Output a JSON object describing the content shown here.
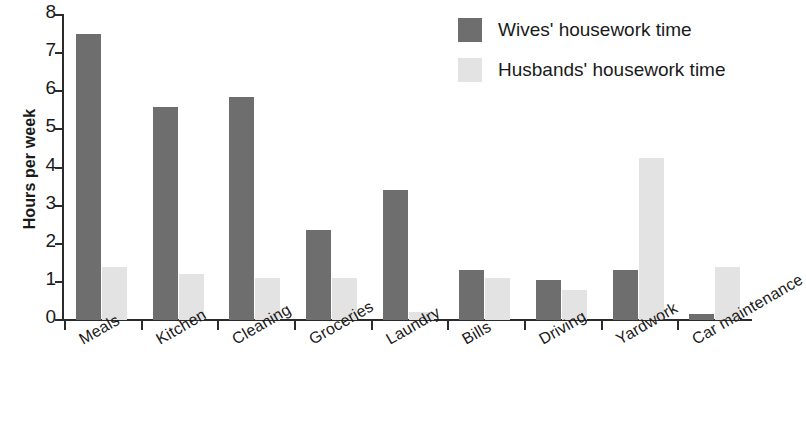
{
  "chart_data": {
    "type": "bar",
    "title": "",
    "xlabel": "",
    "ylabel": "Hours per week",
    "ylim": [
      0,
      8
    ],
    "yticks": [
      "0",
      "1",
      "2",
      "3",
      "4",
      "5",
      "6",
      "7",
      "8"
    ],
    "grid": false,
    "legend_position": "top-right",
    "categories": [
      "Meals",
      "Kitchen",
      "Cleaning",
      "Groceries",
      "Laundry",
      "Bills",
      "Driving",
      "Yardwork",
      "Car maintenance"
    ],
    "series": [
      {
        "name": "Wives' housework time",
        "color": "#6e6e6e",
        "values": [
          7.5,
          5.6,
          5.85,
          2.35,
          3.4,
          1.3,
          1.05,
          1.3,
          0.15
        ]
      },
      {
        "name": "Husbands' housework time",
        "color": "#e3e3e3",
        "values": [
          1.4,
          1.2,
          1.1,
          1.1,
          0.2,
          1.1,
          0.8,
          4.25,
          1.4
        ]
      }
    ]
  },
  "legend": {
    "items": [
      {
        "label": "Wives' housework time",
        "swatch": "wives"
      },
      {
        "label": "Husbands' housework time",
        "swatch": "husbands"
      }
    ]
  },
  "axes": {
    "y_title": "Hours per week"
  }
}
